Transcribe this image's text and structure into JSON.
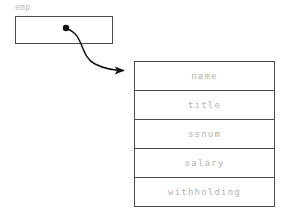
{
  "diagram": {
    "background_color": "#ffffff",
    "stroke_color": "#4a4a4a",
    "text_color": "#b2b2b2",
    "pointer_variable": {
      "label": "emp",
      "box": {
        "x": 15,
        "y": 16,
        "width": 98,
        "height": 28
      },
      "dot": {
        "x": 66,
        "y": 28,
        "radius": 3.2,
        "color": "#111111"
      }
    },
    "arrow": {
      "name": "points-to-arrow",
      "from": {
        "x": 66,
        "y": 28
      },
      "to": {
        "x": 134,
        "y": 70
      },
      "color": "#111111",
      "style": "curved-with-arrowhead"
    },
    "record": {
      "name": "employee-record",
      "x": 134,
      "y": 61,
      "width": 141,
      "row_height": 29,
      "fields": [
        {
          "label": "name"
        },
        {
          "label": "title"
        },
        {
          "label": "ssnum"
        },
        {
          "label": "salary"
        },
        {
          "label": "withholding"
        }
      ]
    }
  }
}
